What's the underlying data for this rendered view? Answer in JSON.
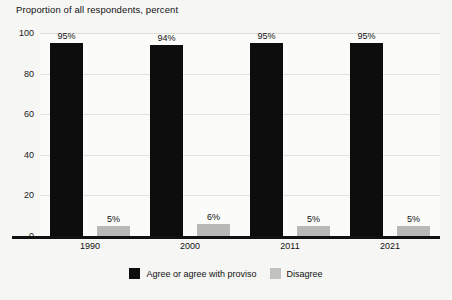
{
  "chart_data": {
    "type": "bar",
    "title": "Proportion of all respondents, percent",
    "xlabel": "",
    "ylabel": "",
    "categories": [
      "1990",
      "2000",
      "2011",
      "2021"
    ],
    "series": [
      {
        "name": "Agree or agree with proviso",
        "color": "#0d0d0d",
        "values": [
          95,
          94,
          95,
          95
        ],
        "labels": [
          "95%",
          "94%",
          "95%",
          "95%"
        ]
      },
      {
        "name": "Disagree",
        "color": "#b9b9b7",
        "values": [
          5,
          6,
          5,
          5
        ],
        "labels": [
          "5%",
          "6%",
          "5%",
          "5%"
        ]
      }
    ],
    "ylim": [
      0,
      100
    ],
    "yticks": [
      0,
      20,
      40,
      60,
      80,
      100
    ],
    "ytick_labels": [
      "0",
      "20",
      "40",
      "60",
      "80",
      "100"
    ],
    "grid": true,
    "legend_position": "bottom"
  },
  "colors": {
    "background": "#f6f6f4",
    "plot_background": "#fbfbfa",
    "gridline": "#e2e2de",
    "axis": "#111111",
    "agree": "#0d0d0d",
    "disagree": "#b9b9b7"
  }
}
